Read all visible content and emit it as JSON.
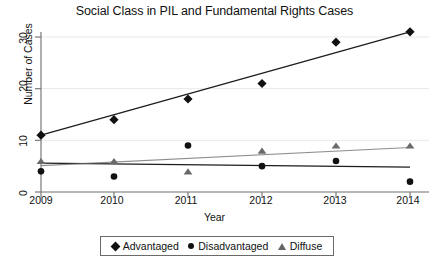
{
  "chart_data": {
    "type": "scatter",
    "title": "Social Class in PIL and Fundamental Rights Cases",
    "xlabel": "Year",
    "ylabel": "Number of Cases",
    "categories": [
      "2009",
      "2010",
      "2011",
      "2012",
      "2013",
      "2014"
    ],
    "x": [
      2009,
      2010,
      2011,
      2012,
      2013,
      2014
    ],
    "xlim": [
      2008.8,
      2014.2
    ],
    "ylim": [
      0,
      32
    ],
    "yticks": [
      0,
      10,
      20,
      30
    ],
    "ytick_labels": [
      "0",
      "10",
      "20",
      "30"
    ],
    "xtick_labels": [
      "2009",
      "2010",
      "2011",
      "2012",
      "2013",
      "2014"
    ],
    "grid": true,
    "legend_position": "bottom",
    "series": [
      {
        "name": "Advantaged",
        "marker": "diamond",
        "color": "#111111",
        "values": [
          11,
          14,
          18,
          21,
          29,
          31
        ],
        "trendline": {
          "start": 11.0,
          "end": 31.0
        }
      },
      {
        "name": "Disadvantaged",
        "marker": "circle",
        "color": "#111111",
        "values": [
          4,
          3,
          9,
          5,
          6,
          2
        ],
        "trendline": {
          "start": 5.6,
          "end": 4.8
        }
      },
      {
        "name": "Diffuse",
        "marker": "triangle",
        "color": "#6a6a6a",
        "values": [
          6,
          6,
          4,
          8,
          9,
          9
        ],
        "trendline": {
          "start": 5.1,
          "end": 8.6
        }
      }
    ]
  },
  "legend": {
    "items": [
      {
        "label": "Advantaged",
        "marker": "diamond"
      },
      {
        "label": "Disadvantaged",
        "marker": "circle"
      },
      {
        "label": "Diffuse",
        "marker": "triangle"
      }
    ]
  }
}
